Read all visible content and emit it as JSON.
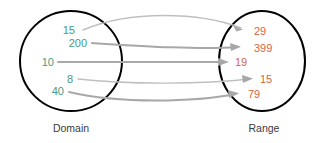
{
  "diagram": {
    "type": "mapping-diagram",
    "title": "",
    "background_color": "#ffffff",
    "sets": {
      "domain": {
        "label": "Domain",
        "value_color": "#3f9c86",
        "outline_color": "#000000",
        "values": [
          "15",
          "200",
          "10",
          "8",
          "40"
        ]
      },
      "range": {
        "label": "Range",
        "value_color": "#d9633f",
        "outline_color": "#000000",
        "values": [
          "29",
          "399",
          "19",
          "15",
          "79"
        ]
      }
    },
    "arrow_color": "#a8a8a8",
    "mappings": [
      {
        "from": "15",
        "to": "29"
      },
      {
        "from": "200",
        "to": "399"
      },
      {
        "from": "10",
        "to": "19"
      },
      {
        "from": "8",
        "to": "15"
      },
      {
        "from": "40",
        "to": "79"
      }
    ]
  }
}
